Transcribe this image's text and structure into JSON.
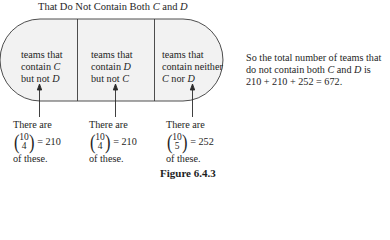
{
  "figure": {
    "title_prefix": "That Do Not Contain Both ",
    "title_var1": "C",
    "title_mid": " and ",
    "title_var2": "D",
    "caption": "Figure 6.4.3",
    "regions": [
      {
        "line1": "teams that",
        "line2_prefix": "contain ",
        "line2_var": "C",
        "line3_prefix": "but not ",
        "line3_var": "D",
        "line3_suffix": ""
      },
      {
        "line1": "teams that",
        "line2_prefix": "contain ",
        "line2_var": "D",
        "line3_prefix": "but not ",
        "line3_var": "C",
        "line3_suffix": ""
      },
      {
        "line1": "teams that",
        "line2_prefix": "contain neither",
        "line2_var": "",
        "line3_prefix": "",
        "line3_var": "C",
        "line3_suffix": " nor ",
        "line3_var2": "D"
      }
    ],
    "counts": [
      {
        "intro": "There are",
        "n": "10",
        "k": "4",
        "value": "= 210",
        "outro": "of these."
      },
      {
        "intro": "There are",
        "n": "10",
        "k": "4",
        "value": "= 210",
        "outro": "of these."
      },
      {
        "intro": "There are",
        "n": "10",
        "k": "5",
        "value": "= 252",
        "outro": "of these."
      }
    ],
    "summary": {
      "line1": "So the total number of teams that",
      "line2_prefix": "do not contain both ",
      "line2_var1": "C",
      "line2_mid": " and ",
      "line2_var2": "D",
      "line2_suffix": " is",
      "line3": "210 + 210 + 252 = 672."
    }
  }
}
